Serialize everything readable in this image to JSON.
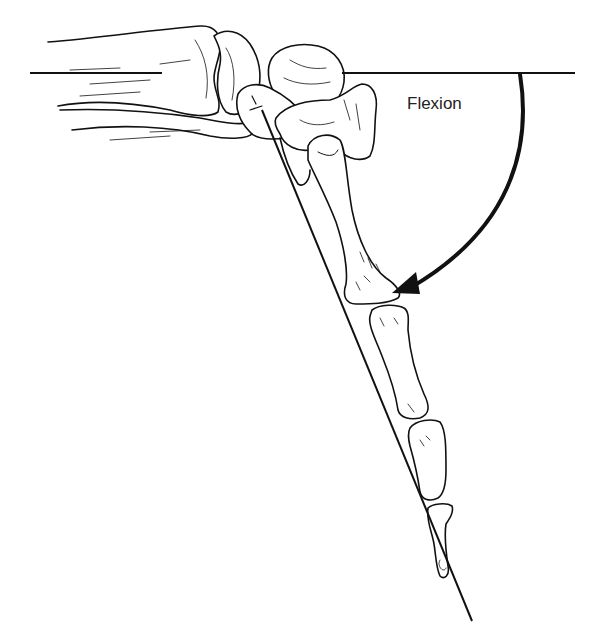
{
  "figure": {
    "type": "anatomical-illustration",
    "annotation": {
      "label": "Flexion",
      "arrow": "curved arrow from horizontal reference line down to the distal metacarpal"
    },
    "reference_lines": [
      {
        "name": "horizontal-reference",
        "description": "horizontal line through the forearm axis"
      },
      {
        "name": "limb-axis-line",
        "description": "oblique line along the flexed distal limb"
      }
    ],
    "colors": {
      "ink": "#111111",
      "background": "#ffffff",
      "bone_fill": "#ffffff"
    }
  }
}
